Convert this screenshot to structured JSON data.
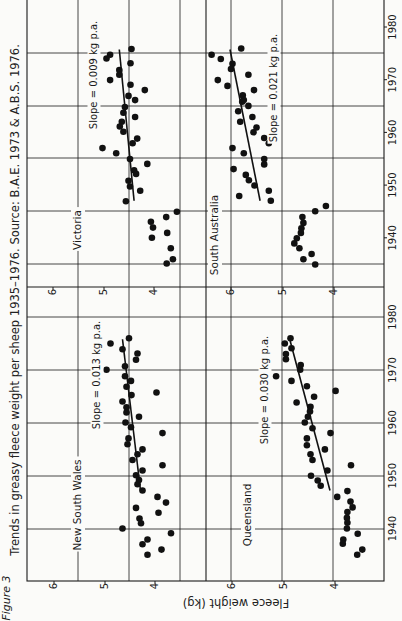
{
  "figure": {
    "label": "Figure 3",
    "caption": "Trends in greasy fleece weight per sheep 1935–1976. Source: B.A.E. 1973 & A.B.S. 1976.",
    "y_axis_label": "Fleece weight (kg)",
    "orientation": "rotated 90° counter-clockwise"
  },
  "chart_data": {
    "type": "scatter",
    "title": "Trends in greasy fleece weight per sheep 1935–1976",
    "source": "B.A.E. 1973 & A.B.S. 1976",
    "xlabel": "Year",
    "ylabel": "Fleece weight (kg)",
    "x_ticks": [
      1940,
      1950,
      1960,
      1970,
      1980
    ],
    "y_ticks": [
      4,
      5,
      6
    ],
    "grid": true,
    "panels": [
      {
        "name": "New South Wales",
        "slope_label": "Slope = 0.013 kg p.a.",
        "trend": [
          [
            1947.3,
            4.29
          ],
          [
            1976.0,
            4.65
          ]
        ],
        "points": [
          [
            1976.2,
            4.52
          ],
          [
            1975.2,
            4.89
          ],
          [
            1974.1,
            4.65
          ],
          [
            1973.3,
            4.35
          ],
          [
            1972.1,
            4.38
          ],
          [
            1970.2,
            4.97
          ],
          [
            1970.9,
            4.6
          ],
          [
            1969.0,
            4.6
          ],
          [
            1968.1,
            4.48
          ],
          [
            1967.0,
            4.57
          ],
          [
            1965.9,
            3.97
          ],
          [
            1965.4,
            4.47
          ],
          [
            1964.2,
            4.65
          ],
          [
            1963.1,
            4.57
          ],
          [
            1962.1,
            4.57
          ],
          [
            1961.3,
            4.32
          ],
          [
            1960.2,
            4.59
          ],
          [
            1959.3,
            4.48
          ],
          [
            1958.2,
            3.85
          ],
          [
            1957.2,
            4.53
          ],
          [
            1956.1,
            4.55
          ],
          [
            1955.1,
            4.25
          ],
          [
            1954.2,
            4.35
          ],
          [
            1953.1,
            4.45
          ],
          [
            1952.1,
            3.85
          ],
          [
            1951.1,
            4.25
          ],
          [
            1950.2,
            4.38
          ],
          [
            1949.3,
            4.32
          ],
          [
            1948.5,
            4.35
          ],
          [
            1947.3,
            4.25
          ],
          [
            1946.1,
            3.95
          ],
          [
            1945.0,
            3.78
          ],
          [
            1944.0,
            4.38
          ],
          [
            1943.1,
            3.93
          ],
          [
            1942.0,
            4.31
          ],
          [
            1941.1,
            4.28
          ],
          [
            1940.1,
            4.65
          ],
          [
            1939.2,
            3.68
          ],
          [
            1938.0,
            4.15
          ],
          [
            1937.1,
            4.25
          ],
          [
            1936.1,
            3.87
          ],
          [
            1935.1,
            4.15
          ]
        ]
      },
      {
        "name": "Victoria",
        "slope_label": "Slope = 0.009 kg p.a.",
        "trend": [
          [
            1947.0,
            4.41
          ],
          [
            1975.7,
            4.7
          ]
        ],
        "points": [
          [
            1975.8,
            4.46
          ],
          [
            1974.7,
            4.88
          ],
          [
            1974.0,
            4.95
          ],
          [
            1973.1,
            4.48
          ],
          [
            1971.8,
            4.7
          ],
          [
            1970.9,
            4.7
          ],
          [
            1969.9,
            4.88
          ],
          [
            1969.0,
            4.48
          ],
          [
            1968.0,
            4.2
          ],
          [
            1966.9,
            4.52
          ],
          [
            1966.1,
            4.39
          ],
          [
            1964.8,
            4.59
          ],
          [
            1963.7,
            4.62
          ],
          [
            1962.9,
            4.39
          ],
          [
            1962.0,
            4.65
          ],
          [
            1961.1,
            4.69
          ],
          [
            1960.1,
            4.62
          ],
          [
            1958.8,
            4.35
          ],
          [
            1957.9,
            4.44
          ],
          [
            1957.0,
            5.03
          ],
          [
            1956.0,
            4.76
          ],
          [
            1954.9,
            4.49
          ],
          [
            1954.0,
            4.15
          ],
          [
            1952.8,
            4.41
          ],
          [
            1952.1,
            4.37
          ],
          [
            1950.8,
            4.52
          ],
          [
            1949.7,
            4.49
          ],
          [
            1948.9,
            4.29
          ],
          [
            1946.9,
            4.57
          ],
          [
            1944.9,
            3.57
          ],
          [
            1943.9,
            3.78
          ],
          [
            1943.0,
            4.08
          ],
          [
            1941.9,
            4.04
          ],
          [
            1940.9,
            3.76
          ],
          [
            1940.0,
            4.06
          ],
          [
            1938.0,
            3.69
          ],
          [
            1935.1,
            3.77
          ],
          [
            1935.9,
            3.65
          ]
        ]
      },
      {
        "name": "Queensland",
        "slope_label": "Slope = 0.030 kg p.a.",
        "trend": [
          [
            1947.3,
            4.09
          ],
          [
            1976.2,
            4.88
          ]
        ],
        "points": [
          [
            1976.2,
            4.86
          ],
          [
            1975.2,
            4.97
          ],
          [
            1974.3,
            4.84
          ],
          [
            1973.2,
            4.95
          ],
          [
            1972.2,
            4.95
          ],
          [
            1971.1,
            4.66
          ],
          [
            1970.2,
            4.67
          ],
          [
            1969.0,
            5.14
          ],
          [
            1968.1,
            4.84
          ],
          [
            1967.1,
            4.54
          ],
          [
            1966.2,
            3.98
          ],
          [
            1965.1,
            4.4
          ],
          [
            1964.0,
            4.74
          ],
          [
            1963.2,
            4.47
          ],
          [
            1962.3,
            4.48
          ],
          [
            1961.3,
            4.52
          ],
          [
            1960.2,
            4.58
          ],
          [
            1959.1,
            4.43
          ],
          [
            1958.2,
            4.08
          ],
          [
            1957.2,
            4.54
          ],
          [
            1955.9,
            4.54
          ],
          [
            1955.1,
            4.19
          ],
          [
            1954.2,
            4.47
          ],
          [
            1953.1,
            4.43
          ],
          [
            1952.1,
            3.68
          ],
          [
            1951.1,
            4.14
          ],
          [
            1950.1,
            4.46
          ],
          [
            1949.2,
            4.33
          ],
          [
            1948.2,
            4.27
          ],
          [
            1947.2,
            3.75
          ],
          [
            1946.1,
            3.95
          ],
          [
            1945.2,
            3.69
          ],
          [
            1944.1,
            3.65
          ],
          [
            1943.2,
            3.75
          ],
          [
            1942.1,
            3.76
          ],
          [
            1941.2,
            3.75
          ],
          [
            1940.1,
            3.76
          ],
          [
            1939.1,
            3.55
          ],
          [
            1938.0,
            3.83
          ],
          [
            1937.2,
            3.84
          ],
          [
            1936.1,
            3.46
          ],
          [
            1935.1,
            3.56
          ]
        ]
      },
      {
        "name": "South Australia",
        "slope_label": "Slope = 0.021 kg p.a.",
        "trend": [
          [
            1947.0,
            5.41
          ],
          [
            1975.7,
            6.0
          ]
        ],
        "points": [
          [
            1975.9,
            5.78
          ],
          [
            1974.7,
            6.36
          ],
          [
            1973.9,
            6.18
          ],
          [
            1973.0,
            5.95
          ],
          [
            1972.0,
            5.98
          ],
          [
            1970.9,
            5.64
          ],
          [
            1969.9,
            6.24
          ],
          [
            1968.8,
            6.05
          ],
          [
            1968.0,
            5.53
          ],
          [
            1967.0,
            5.75
          ],
          [
            1966.1,
            5.73
          ],
          [
            1965.8,
            5.76
          ],
          [
            1965.0,
            5.64
          ],
          [
            1964.0,
            5.84
          ],
          [
            1962.9,
            5.56
          ],
          [
            1962.0,
            5.8
          ],
          [
            1960.9,
            5.48
          ],
          [
            1960.0,
            5.54
          ],
          [
            1958.9,
            5.33
          ],
          [
            1957.9,
            5.24
          ],
          [
            1957.0,
            5.95
          ],
          [
            1956.0,
            5.73
          ],
          [
            1954.9,
            5.33
          ],
          [
            1953.9,
            5.33
          ],
          [
            1953.0,
            5.93
          ],
          [
            1951.9,
            5.69
          ],
          [
            1950.9,
            5.63
          ],
          [
            1949.9,
            5.52
          ],
          [
            1948.9,
            5.24
          ],
          [
            1947.9,
            5.82
          ],
          [
            1947.0,
            5.2
          ],
          [
            1945.0,
            4.33
          ],
          [
            1946.0,
            4.12
          ],
          [
            1943.9,
            4.58
          ],
          [
            1942.8,
            4.56
          ],
          [
            1941.8,
            4.6
          ],
          [
            1940.9,
            4.61
          ],
          [
            1939.9,
            4.69
          ],
          [
            1938.9,
            4.74
          ],
          [
            1938.0,
            4.64
          ],
          [
            1935.9,
            4.56
          ],
          [
            1936.9,
            4.4
          ],
          [
            1934.9,
            4.33
          ]
        ]
      }
    ]
  }
}
